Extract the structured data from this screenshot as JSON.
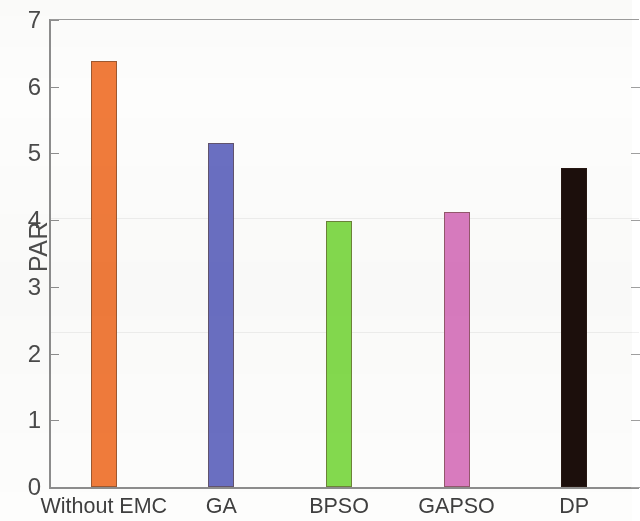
{
  "chart_data": {
    "type": "bar",
    "title": "",
    "xlabel": "",
    "ylabel": "PAR",
    "categories": [
      "Without EMC",
      "GA",
      "BPSO",
      "GAPSO",
      "DP"
    ],
    "values": [
      6.38,
      5.15,
      3.99,
      4.12,
      4.78
    ],
    "series": [
      {
        "name": "PAR",
        "values": [
          6.38,
          5.15,
          3.99,
          4.12,
          4.78
        ]
      }
    ],
    "bar_colors": [
      "#F07B3B",
      "#6A6FC2",
      "#84DA4E",
      "#D97BBF",
      "#1C0F0C"
    ],
    "ylim": [
      0,
      7
    ],
    "yticks": [
      0,
      1,
      2,
      3,
      4,
      5,
      6,
      7
    ],
    "ytick_labels": [
      "0",
      "1",
      "2",
      "3",
      "4",
      "5",
      "6",
      "7"
    ],
    "xtick_labels": [
      "Without EMC",
      "GA",
      "BPSO",
      "GAPSO",
      "DP"
    ],
    "grid": false,
    "legend": null,
    "axis_color": "#8d8d8d",
    "background": "#ffffff"
  }
}
